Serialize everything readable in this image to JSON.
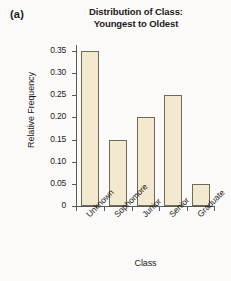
{
  "panel": {
    "label": "(a)"
  },
  "chart_data": {
    "type": "bar",
    "title": "Distribution of Class: Youngest to Oldest",
    "title_lines": [
      "Distribution of Class:",
      "Youngest to Oldest"
    ],
    "xlabel": "Class",
    "ylabel": "Relative Frequency",
    "categories": [
      "Unknown",
      "Sophomore",
      "Junior",
      "Senior",
      "Graduate"
    ],
    "values": [
      0.35,
      0.15,
      0.2,
      0.25,
      0.05
    ],
    "ylim": [
      0,
      0.35
    ],
    "yticks": [
      0,
      0.05,
      0.1,
      0.15,
      0.2,
      0.25,
      0.3,
      0.35
    ],
    "ytick_labels": [
      "0",
      "0.05",
      "0.10",
      "0.15",
      "0.20",
      "0.25",
      "0.30",
      "0.35"
    ],
    "grid": false,
    "legend": null,
    "bar_fill_color": "#F3E9CE",
    "bar_edge_color": "#6F6A58",
    "axis_color": "#59595A",
    "xtick_label_rotation": -45
  }
}
